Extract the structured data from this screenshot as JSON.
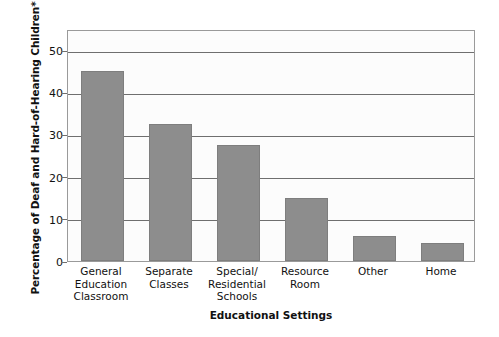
{
  "chart_data": {
    "type": "bar",
    "title": "",
    "subtitle": "",
    "xlabel": "Educational Settings",
    "ylabel": "Percentage of Deaf and Hard-of-Hearing Children*",
    "categories": [
      "General Education Classroom",
      "Separate Classes",
      "Special/ Residential Schools",
      "Resource Room",
      "Other",
      "Home"
    ],
    "category_lines": [
      [
        "General",
        "Education",
        "Classroom"
      ],
      [
        "Separate",
        "Classes"
      ],
      [
        "Special/",
        "Residential",
        "Schools"
      ],
      [
        "Resource",
        "Room"
      ],
      [
        "Other"
      ],
      [
        "Home"
      ]
    ],
    "values": [
      45,
      32.5,
      27.5,
      15,
      6,
      4.2
    ],
    "series": [
      {
        "name": "Percentage of Deaf and Hard-of-Hearing Children",
        "values": [
          45,
          32.5,
          27.5,
          15,
          6,
          4.2
        ]
      }
    ],
    "ylim": [
      0,
      55
    ],
    "yticks": [
      0,
      10,
      20,
      30,
      40,
      50
    ],
    "ytick_labels": [
      "0",
      "10",
      "20",
      "30",
      "40",
      "50"
    ],
    "grid": true,
    "grid_axis": "y",
    "legend": false,
    "legend_position": "none",
    "bar_color": "#8d8d8d",
    "bar_edge_color": "#7e7e7e",
    "grid_color": "#6f6f6f",
    "frame_color": "#9a9a9a",
    "plot_background": "#fcfcfc",
    "text_color": "#111111",
    "annotations": [
      "*Asterisk in y-axis title"
    ]
  }
}
